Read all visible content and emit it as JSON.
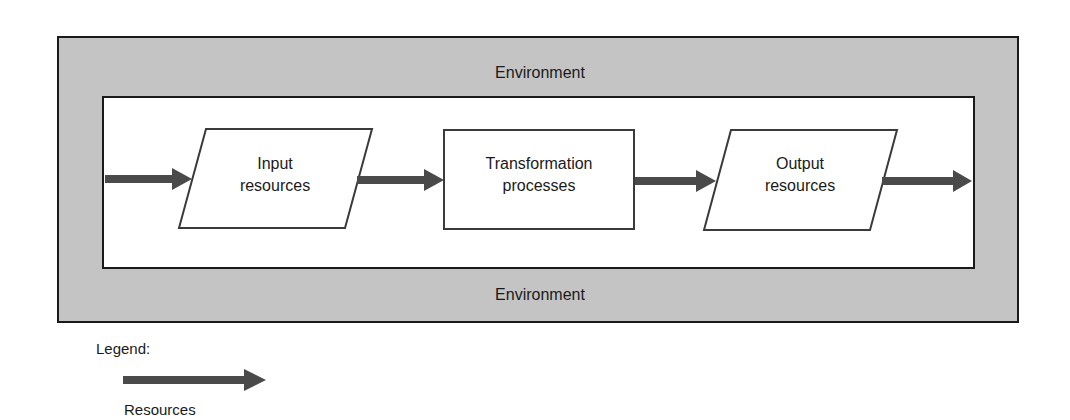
{
  "diagram": {
    "environment_top_label": "Environment",
    "environment_bottom_label": "Environment",
    "nodes": [
      {
        "id": "input",
        "shape": "parallelogram",
        "line1": "Input",
        "line2": "resources"
      },
      {
        "id": "transform",
        "shape": "rectangle",
        "line1": "Transformation",
        "line2": "processes"
      },
      {
        "id": "output",
        "shape": "parallelogram",
        "line1": "Output",
        "line2": "resources"
      }
    ],
    "edges": [
      {
        "from": "environment",
        "to": "input",
        "type": "resources"
      },
      {
        "from": "input",
        "to": "transform",
        "type": "resources"
      },
      {
        "from": "transform",
        "to": "output",
        "type": "resources"
      },
      {
        "from": "output",
        "to": "environment",
        "type": "resources"
      }
    ]
  },
  "legend": {
    "title": "Legend:",
    "items": [
      {
        "symbol": "thick-arrow",
        "label": "Resources"
      }
    ]
  },
  "colors": {
    "environment_fill": "#c4c4c4",
    "arrow": "#4a4a4a",
    "stroke": "#1a1a1a"
  }
}
